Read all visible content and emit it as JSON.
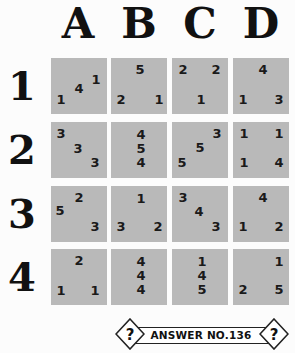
{
  "columns": [
    "A",
    "B",
    "C",
    "D"
  ],
  "rows": [
    "1",
    "2",
    "3",
    "4"
  ],
  "cells": {
    "A1": [
      {
        "v": "1",
        "x": 45,
        "y": 22
      },
      {
        "v": "4",
        "x": 28,
        "y": 31
      },
      {
        "v": "1",
        "x": 10,
        "y": 42
      }
    ],
    "B1": [
      {
        "v": "5",
        "x": 29,
        "y": 12
      },
      {
        "v": "2",
        "x": 10,
        "y": 42
      },
      {
        "v": "1",
        "x": 48,
        "y": 42
      }
    ],
    "C1": [
      {
        "v": "2",
        "x": 11,
        "y": 12
      },
      {
        "v": "2",
        "x": 44,
        "y": 12
      },
      {
        "v": "1",
        "x": 29,
        "y": 42
      }
    ],
    "D1": [
      {
        "v": "4",
        "x": 30,
        "y": 12
      },
      {
        "v": "1",
        "x": 10,
        "y": 42
      },
      {
        "v": "3",
        "x": 46,
        "y": 42
      }
    ],
    "A2": [
      {
        "v": "3",
        "x": 10,
        "y": 12
      },
      {
        "v": "3",
        "x": 27,
        "y": 27
      },
      {
        "v": "3",
        "x": 44,
        "y": 41
      }
    ],
    "B2": [
      {
        "v": "4",
        "x": 30,
        "y": 13
      },
      {
        "v": "5",
        "x": 30,
        "y": 27
      },
      {
        "v": "4",
        "x": 30,
        "y": 41
      }
    ],
    "C2": [
      {
        "v": "3",
        "x": 45,
        "y": 12
      },
      {
        "v": "5",
        "x": 28,
        "y": 26
      },
      {
        "v": "5",
        "x": 10,
        "y": 41
      }
    ],
    "D2": [
      {
        "v": "1",
        "x": 11,
        "y": 12
      },
      {
        "v": "1",
        "x": 46,
        "y": 12
      },
      {
        "v": "1",
        "x": 11,
        "y": 41
      },
      {
        "v": "4",
        "x": 46,
        "y": 41
      }
    ],
    "A3": [
      {
        "v": "2",
        "x": 28,
        "y": 12
      },
      {
        "v": "5",
        "x": 9,
        "y": 25
      },
      {
        "v": "3",
        "x": 44,
        "y": 41
      }
    ],
    "B3": [
      {
        "v": "1",
        "x": 30,
        "y": 13
      },
      {
        "v": "3",
        "x": 10,
        "y": 41
      },
      {
        "v": "2",
        "x": 47,
        "y": 41
      }
    ],
    "C3": [
      {
        "v": "3",
        "x": 11,
        "y": 12
      },
      {
        "v": "4",
        "x": 27,
        "y": 26
      },
      {
        "v": "3",
        "x": 44,
        "y": 41
      }
    ],
    "D3": [
      {
        "v": "4",
        "x": 30,
        "y": 12
      },
      {
        "v": "1",
        "x": 10,
        "y": 41
      },
      {
        "v": "2",
        "x": 46,
        "y": 41
      }
    ],
    "A4": [
      {
        "v": "2",
        "x": 28,
        "y": 12
      },
      {
        "v": "1",
        "x": 10,
        "y": 42
      },
      {
        "v": "1",
        "x": 44,
        "y": 42
      }
    ],
    "B4": [
      {
        "v": "4",
        "x": 30,
        "y": 13
      },
      {
        "v": "4",
        "x": 30,
        "y": 27
      },
      {
        "v": "4",
        "x": 30,
        "y": 41
      }
    ],
    "C4": [
      {
        "v": "1",
        "x": 30,
        "y": 13
      },
      {
        "v": "4",
        "x": 30,
        "y": 27
      },
      {
        "v": "5",
        "x": 30,
        "y": 41
      }
    ],
    "D4": [
      {
        "v": "1",
        "x": 46,
        "y": 13
      },
      {
        "v": "2",
        "x": 10,
        "y": 41
      },
      {
        "v": "5",
        "x": 46,
        "y": 41
      }
    ]
  },
  "banner": {
    "text": "ANSWER NO.136",
    "icon_left": "?",
    "icon_right": "?"
  },
  "colors": {
    "cell_bg": "#b9b9b9",
    "text": "#1a1a1a",
    "background": "#fcfcfc"
  }
}
